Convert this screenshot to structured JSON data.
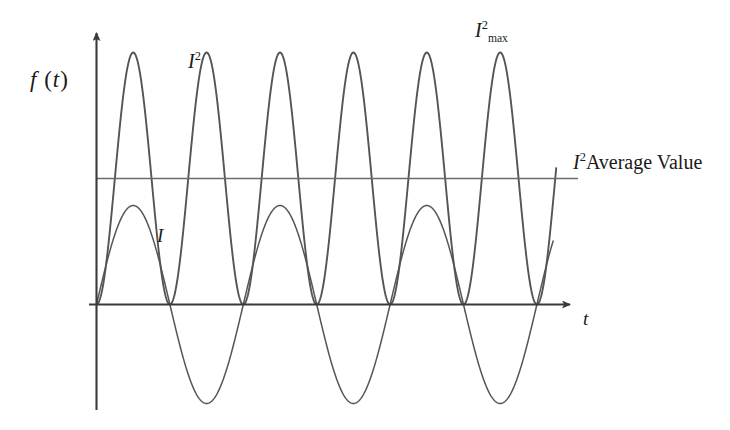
{
  "figure": {
    "background_color": "#ffffff",
    "curve_color": "#555555",
    "axis_color": "#3a3a3a",
    "text_color": "#1a1a1a"
  },
  "labels": {
    "y_axis": {
      "name": "f-of-t",
      "base": "f",
      "paren_open": " (",
      "var": "t",
      "paren_close": ")"
    },
    "x_axis": {
      "name": "t-axis-label",
      "text": "t"
    },
    "current_squared": {
      "base": "I",
      "sup": "2"
    },
    "current_squared_max": {
      "base": "I",
      "sup": "2",
      "sub": "max"
    },
    "average_value": {
      "base": "I",
      "sup": "2",
      "text": "Average Value"
    },
    "current": {
      "text": "I"
    }
  },
  "chart_data": {
    "type": "line",
    "title": "",
    "xlabel": "t",
    "ylabel": "f (t)",
    "grid": false,
    "legend": "inline-annotations",
    "xlim": [
      0,
      3.05
    ],
    "ylim": [
      -1.05,
      1.05
    ],
    "series": [
      {
        "name": "I",
        "expression": "sin(2*pi*x)",
        "annotation": "I",
        "amplitude": 1.0,
        "periods": 3,
        "zero_crossings": [
          0,
          1,
          2,
          3
        ],
        "peaks": [
          {
            "x": 0.25,
            "y": 0.68
          },
          {
            "x": 1.25,
            "y": 0.68
          },
          {
            "x": 2.25,
            "y": 0.68
          }
        ],
        "troughs": [
          {
            "x": 0.75,
            "y": -0.68
          },
          {
            "x": 1.75,
            "y": -0.68
          },
          {
            "x": 2.75,
            "y": -0.68
          }
        ]
      },
      {
        "name": "I^2",
        "expression": "sin(2*pi*x)^2",
        "annotation": "I²",
        "amplitude": 1.0,
        "periods": 6,
        "zero_crossings": [
          0,
          1,
          2,
          3
        ],
        "peaks": [
          {
            "x": 0.25,
            "y": 1.0
          },
          {
            "x": 1.25,
            "y": 1.0
          },
          {
            "x": 2.25,
            "y": 1.0
          }
        ],
        "max_label": "I²max"
      },
      {
        "name": "I^2 Average Value",
        "type": "horizontal-reference-line",
        "value": 0.5,
        "annotation": "I² Average Value"
      }
    ]
  }
}
